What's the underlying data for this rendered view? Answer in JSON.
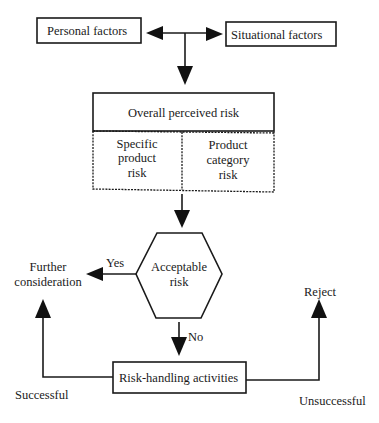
{
  "diagram": {
    "colors": {
      "stroke": "#1a1a1a",
      "background": "#ffffff"
    },
    "nodes": {
      "personal_factors": {
        "label": "Personal factors"
      },
      "situational_factors": {
        "label": "Situational factors"
      },
      "overall_risk": {
        "label": "Overall perceived risk",
        "components": [
          {
            "lines": [
              "Specific",
              "product",
              "risk"
            ]
          },
          {
            "lines": [
              "Product",
              "category",
              "risk"
            ]
          }
        ]
      },
      "acceptable_risk": {
        "lines": [
          "Acceptable",
          "risk"
        ]
      },
      "further_consideration": {
        "lines": [
          "Further",
          "consideration"
        ]
      },
      "reject": {
        "label": "Reject"
      },
      "risk_handling": {
        "label": "Risk-handling activities"
      }
    },
    "edges": {
      "yes": "Yes",
      "no": "No",
      "successful": "Successful",
      "unsuccessful": "Unsuccessful"
    }
  }
}
